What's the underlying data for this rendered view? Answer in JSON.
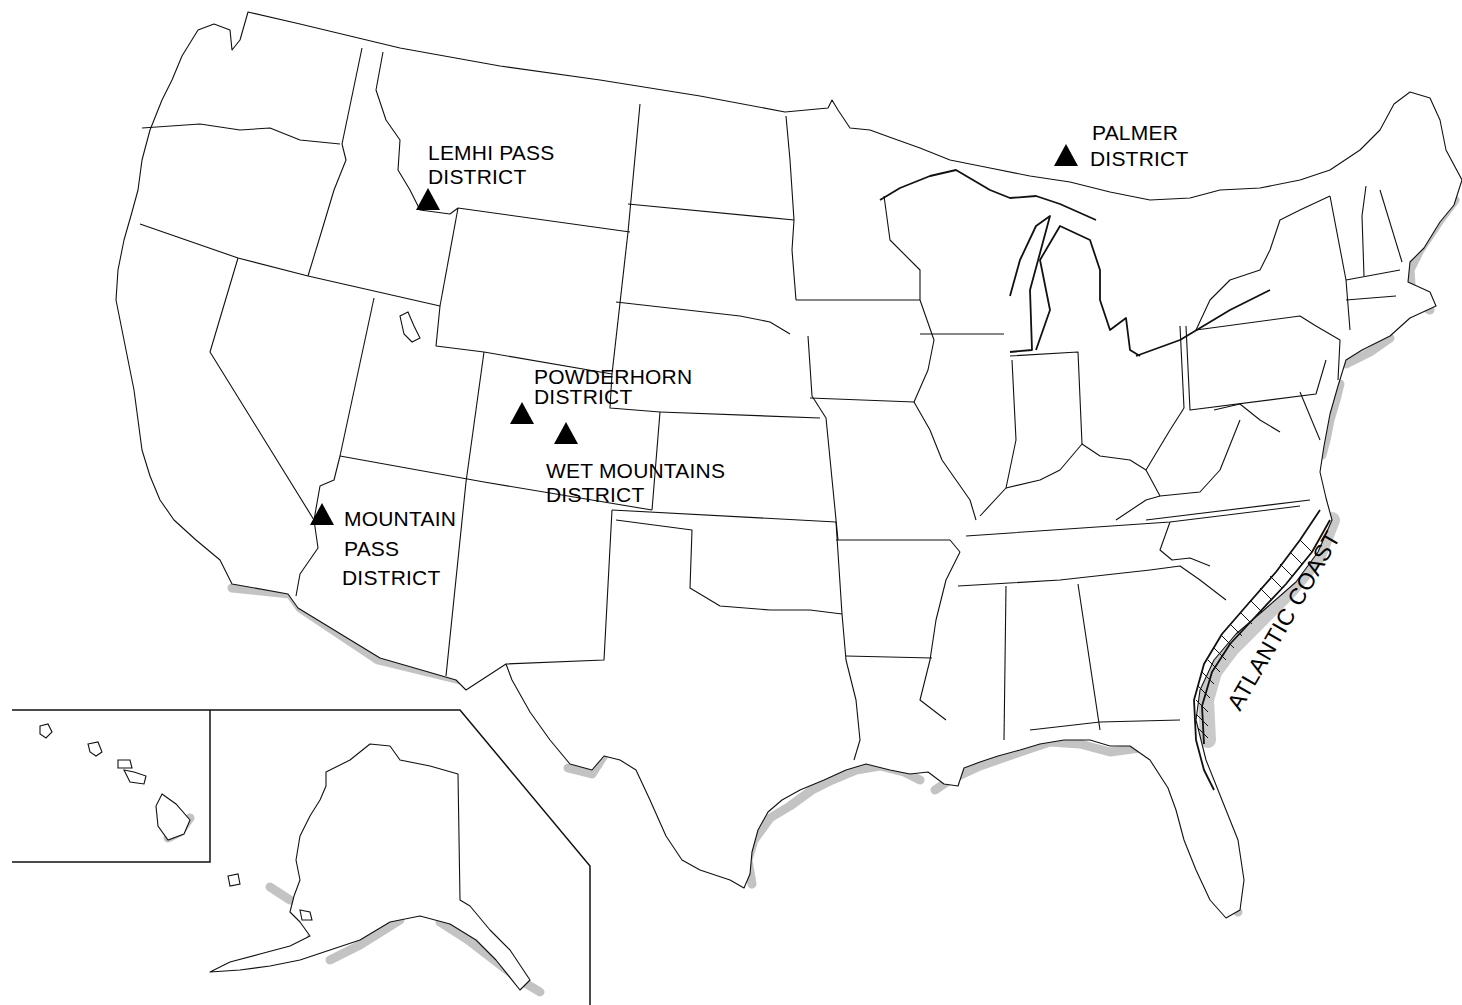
{
  "map": {
    "title": "",
    "regions_shown": [
      "Contiguous United States",
      "Alaska inset",
      "Hawaii inset"
    ],
    "colors": {
      "background": "#ffffff",
      "outline": "#111111",
      "coastal_shading": "#b8b8b8",
      "marker": "#000000"
    }
  },
  "districts": [
    {
      "id": "lemhi-pass",
      "lines": [
        "LEMHI PASS",
        "DISTRICT"
      ],
      "marker": "filled-triangle"
    },
    {
      "id": "palmer",
      "lines": [
        "PALMER",
        "DISTRICT"
      ],
      "marker": "filled-triangle"
    },
    {
      "id": "powderhorn",
      "lines": [
        "POWDERHORN",
        "DISTRICT"
      ],
      "marker": "filled-triangle"
    },
    {
      "id": "wet-mountains",
      "lines": [
        "WET MOUNTAINS",
        "DISTRICT"
      ],
      "marker": "filled-triangle"
    },
    {
      "id": "mountain-pass",
      "lines": [
        "MOUNTAIN",
        "PASS",
        "DISTRICT"
      ],
      "marker": "filled-triangle"
    }
  ],
  "coastal_region": {
    "label": "ATLANTIC COAST",
    "style": "hatched band"
  }
}
